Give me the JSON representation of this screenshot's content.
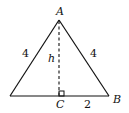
{
  "diagram": {
    "type": "isosceles-triangle-with-altitude",
    "vertices": {
      "apex": {
        "label": "A",
        "x": 59,
        "y": 20
      },
      "left": {
        "label": "",
        "x": 10,
        "y": 96
      },
      "right": {
        "label": "B",
        "x": 109,
        "y": 96
      },
      "foot": {
        "label": "C",
        "x": 59,
        "y": 96
      }
    },
    "labels": {
      "A": "A",
      "B": "B",
      "C": "C",
      "h": "h",
      "left_side": "4",
      "right_side": "4",
      "half_base": "2"
    },
    "colors": {
      "stroke": "#111111",
      "background": "#ffffff"
    }
  }
}
